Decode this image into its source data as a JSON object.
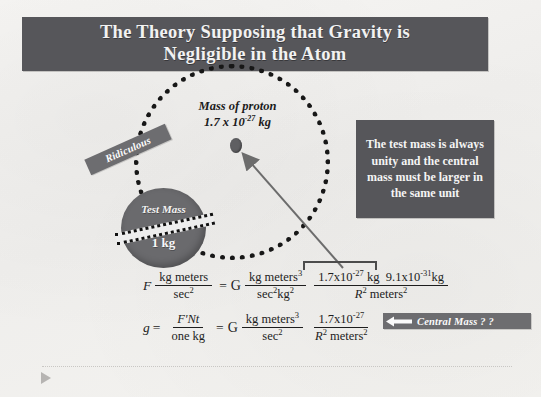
{
  "slide": {
    "title_line1": "The Theory Supposing that Gravity is",
    "title_line2": "Negligible in the Atom",
    "title_bg_color": "#56565a",
    "paper_bg_color": "#f4f3f1"
  },
  "diagram": {
    "proton_label_line1": "Mass of proton",
    "proton_value_mantissa": "1.7 x 10",
    "proton_value_exponent": "-27",
    "proton_value_unit": " kg",
    "ridiculous_label": "Ridiculous",
    "test_mass_label": "Test Mass",
    "test_mass_value": "1 kg",
    "orbit_style": "dotted-circle",
    "shape_color": "#6a6a6d"
  },
  "note_box": {
    "text": "The test mass is always unity and the central mass must be larger in the same unit",
    "bg_color": "#56565a"
  },
  "equation_1": {
    "lhs_symbol": "F",
    "lhs_num": "kg meters",
    "lhs_den": "sec",
    "lhs_den_exp": "2",
    "equals": "=",
    "g_symbol": "G",
    "t1_num": "kg meters",
    "t1_num_exp": "3",
    "t1_den": "sec",
    "t1_den_exp1": "2",
    "t1_den_kg": "kg",
    "t1_den_exp2": "2",
    "t2_num_a": "1.7x10",
    "t2_num_a_exp": "-27",
    "t2_num_a_unit": " kg",
    "t2_num_b": "9.1x10",
    "t2_num_b_exp": "-31",
    "t2_num_b_unit": "kg",
    "t2_den_r": "R",
    "t2_den_r_exp": "2",
    "t2_den_m": " meters",
    "t2_den_m_exp": "2"
  },
  "equation_2": {
    "lhs_symbol": "g",
    "equals1": "=",
    "lhs_num": "F'Nt",
    "lhs_den": "one kg",
    "equals2": "=",
    "g_symbol": "G",
    "t1_num": "kg meters",
    "t1_num_exp": "3",
    "t1_den": "sec",
    "t1_den_exp": "2",
    "t2_num": "1.7x10",
    "t2_num_exp": "-27",
    "t2_den_r": "R",
    "t2_den_r_exp": "2",
    "t2_den_m": " meters",
    "t2_den_m_exp": "2"
  },
  "callout": {
    "text": "Central Mass ? ?",
    "bg_color": "#6d6d70",
    "arrow_direction": "left"
  }
}
